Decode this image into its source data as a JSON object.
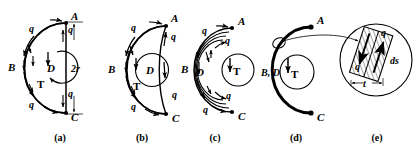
{
  "figure": {
    "background_color": "#ffffff",
    "stroke_color": "#000000"
  },
  "panels": [
    {
      "id": "a",
      "caption": "(a)",
      "caption_x": 60,
      "caption_y": 141,
      "labels": {
        "point_a": "A",
        "point_c": "C",
        "point_b": "B",
        "point_d": "D",
        "torque": "T",
        "dimension": "2r",
        "shear_flow": "q"
      },
      "shear_flow_count": 4
    },
    {
      "id": "b",
      "caption": "(b)",
      "caption_x": 142,
      "caption_y": 141,
      "labels": {
        "point_a": "A",
        "point_c": "C",
        "point_b": "B",
        "point_d": "D",
        "torque": "T",
        "shear_flow": "q"
      },
      "shear_flow_count": 4
    },
    {
      "id": "c",
      "caption": "(c)",
      "caption_x": 215,
      "caption_y": 141,
      "labels": {
        "point_a": "A",
        "point_c": "C",
        "point_b": "B",
        "point_d": "D",
        "torque": "T",
        "shear_flow": "q"
      },
      "shear_flow_count": 4
    },
    {
      "id": "d",
      "caption": "(d)",
      "caption_x": 296,
      "caption_y": 141,
      "labels": {
        "point_a": "A",
        "point_c": "C",
        "points_bd": "B, D",
        "torque": "T"
      }
    },
    {
      "id": "e",
      "caption": "(e)",
      "caption_x": 377,
      "caption_y": 141,
      "labels": {
        "shear_flow_lower": "q",
        "shear_flow_upper": "q",
        "arc_length": "ds",
        "thickness": "t"
      }
    }
  ]
}
